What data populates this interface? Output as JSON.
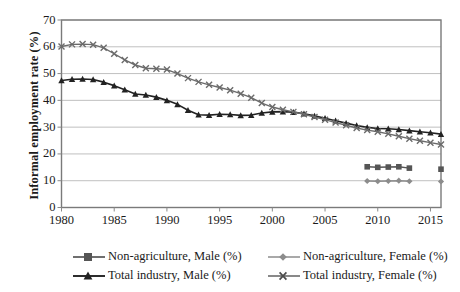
{
  "chart_data": {
    "type": "line",
    "title": "",
    "xlabel": "",
    "ylabel": "Informal employment rate (%)",
    "xlim": [
      1980,
      2016
    ],
    "ylim": [
      0,
      70
    ],
    "ytick_labels": [
      "0",
      "10",
      "20",
      "30",
      "40",
      "50",
      "60",
      "70"
    ],
    "ytick_values": [
      0,
      10,
      20,
      30,
      40,
      50,
      60,
      70
    ],
    "xtick_labels": [
      "1980",
      "1985",
      "1990",
      "1995",
      "2000",
      "2005",
      "2010",
      "2015"
    ],
    "xtick_values": [
      1980,
      1985,
      1990,
      1995,
      2000,
      2005,
      2010,
      2015
    ],
    "grid": "horizontal",
    "legend_position": "bottom",
    "series": [
      {
        "name": "Non-agriculture, Male (%)",
        "marker": "square",
        "color": "#555555",
        "x": [
          2009,
          2010,
          2011,
          2012,
          2013,
          2016
        ],
        "values": [
          15.2,
          15.0,
          15.1,
          15.2,
          14.7,
          14.3
        ]
      },
      {
        "name": "Non-agriculture, Female (%)",
        "marker": "diamond",
        "color": "#8c8c8c",
        "x": [
          2009,
          2010,
          2011,
          2012,
          2013,
          2016
        ],
        "values": [
          9.9,
          9.8,
          9.9,
          10.0,
          9.8,
          9.7
        ]
      },
      {
        "name": "Total industry, Male (%)",
        "marker": "triangle",
        "color": "#222222",
        "x": [
          1980,
          1981,
          1982,
          1983,
          1984,
          1985,
          1986,
          1987,
          1988,
          1989,
          1990,
          1991,
          1992,
          1993,
          1994,
          1995,
          1996,
          1997,
          1998,
          1999,
          2000,
          2001,
          2002,
          2003,
          2004,
          2005,
          2006,
          2007,
          2008,
          2009,
          2010,
          2011,
          2012,
          2013,
          2014,
          2015,
          2016
        ],
        "values": [
          47.4,
          47.9,
          48.0,
          47.8,
          46.8,
          45.5,
          44.0,
          42.4,
          42.0,
          41.2,
          40.0,
          38.5,
          36.3,
          34.6,
          34.5,
          34.8,
          34.7,
          34.4,
          34.5,
          35.3,
          35.7,
          35.8,
          35.6,
          35.0,
          34.2,
          33.3,
          32.4,
          31.5,
          30.6,
          29.9,
          29.5,
          29.4,
          29.1,
          28.7,
          28.3,
          27.9,
          27.4
        ]
      },
      {
        "name": "Total industry, Female (%)",
        "marker": "cross",
        "color": "#6b6b6b",
        "x": [
          1980,
          1981,
          1982,
          1983,
          1984,
          1985,
          1986,
          1987,
          1988,
          1989,
          1990,
          1991,
          1992,
          1993,
          1994,
          1995,
          1996,
          1997,
          1998,
          1999,
          2000,
          2001,
          2002,
          2003,
          2004,
          2005,
          2006,
          2007,
          2008,
          2009,
          2010,
          2011,
          2012,
          2013,
          2014,
          2015,
          2016
        ],
        "values": [
          60.1,
          60.9,
          61.0,
          60.8,
          59.6,
          57.4,
          55.1,
          53.2,
          52.0,
          51.8,
          51.5,
          50.0,
          48.3,
          46.9,
          45.8,
          44.8,
          43.8,
          42.5,
          41.0,
          39.0,
          37.5,
          36.5,
          35.7,
          34.8,
          33.8,
          32.8,
          31.7,
          30.7,
          29.7,
          28.9,
          28.3,
          27.5,
          26.6,
          25.7,
          24.9,
          24.2,
          23.5
        ]
      }
    ]
  },
  "legend": {
    "items": [
      {
        "label": "Non-agriculture, Male (%)"
      },
      {
        "label": "Non-agriculture, Female (%)"
      },
      {
        "label": "Total industry, Male (%)"
      },
      {
        "label": "Total industry, Female (%)"
      }
    ]
  }
}
